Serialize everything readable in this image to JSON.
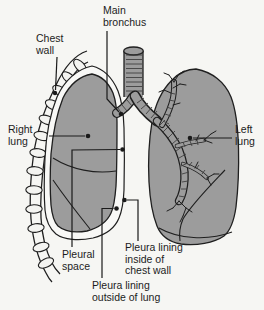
{
  "figure_labels": {
    "main_bronchus": {
      "lines": [
        "Main",
        "bronchus"
      ]
    },
    "chest_wall": {
      "lines": [
        "Chest",
        "wall"
      ]
    },
    "right_lung": {
      "lines": [
        "Right",
        "lung"
      ]
    },
    "left_lung": {
      "lines": [
        "Left",
        "lung"
      ]
    },
    "pleural_space": {
      "lines": [
        "Pleural",
        "space"
      ]
    },
    "pleura_lining_inside": {
      "lines": [
        "Pleura lining",
        "inside of",
        "chest wall"
      ]
    },
    "pleura_lining_outside": {
      "lines": [
        "Pleura lining",
        "outside of lung"
      ]
    }
  },
  "colors": {
    "background": "#f6f6f3",
    "outline": "#1f1f1f",
    "lung_fill": "#9c9c9c",
    "lining_fill": "#f8f8f6",
    "rib_fill": "#f4f4f1",
    "hatch": "#3f3f3f",
    "leader": "#1a1a1a",
    "text": "#1c1c1c"
  }
}
